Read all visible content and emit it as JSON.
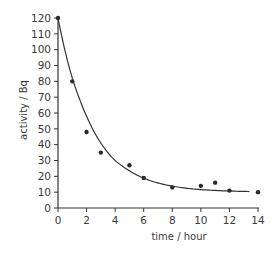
{
  "chart_data": {
    "type": "scatter",
    "title": "",
    "xlabel": "time / hour",
    "ylabel": "activity / Bq",
    "xlim": [
      0,
      14
    ],
    "ylim": [
      0,
      120
    ],
    "x_ticks": [
      0,
      2,
      4,
      6,
      8,
      10,
      12,
      14
    ],
    "y_ticks": [
      0,
      10,
      20,
      30,
      40,
      50,
      60,
      70,
      80,
      90,
      100,
      110,
      120
    ],
    "grid": false,
    "legend": null,
    "series": [
      {
        "name": "measured activity",
        "kind": "points",
        "x": [
          0,
          1,
          2,
          3,
          5,
          6,
          8,
          10,
          11,
          12,
          14
        ],
        "y": [
          120,
          80,
          48,
          35,
          27,
          19,
          13,
          14,
          16,
          11,
          10
        ]
      },
      {
        "name": "best-fit decay curve",
        "kind": "line",
        "x": [
          0,
          0.5,
          1,
          1.5,
          2,
          3,
          4,
          5,
          6,
          7,
          8,
          9,
          10,
          11,
          12,
          13.4
        ],
        "y": [
          120,
          99,
          82,
          69,
          58,
          41,
          30,
          23.5,
          18.8,
          15.8,
          13.8,
          12.5,
          11.6,
          11.1,
          10.7,
          10.4
        ]
      }
    ],
    "colors": {
      "axis": "#333333",
      "points": "#2a2a2a",
      "curve": "#333333"
    }
  }
}
